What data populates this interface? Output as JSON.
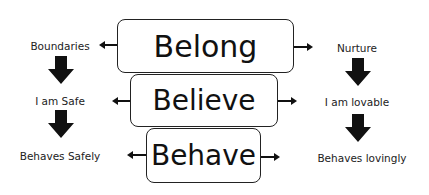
{
  "diagram": {
    "center": [
      {
        "id": "belong",
        "label": "Belong"
      },
      {
        "id": "believe",
        "label": "Believe"
      },
      {
        "id": "behave",
        "label": "Behave"
      }
    ],
    "left_column": [
      {
        "label": "Boundaries"
      },
      {
        "label": "I am Safe"
      },
      {
        "label": "Behaves Safely"
      }
    ],
    "right_column": [
      {
        "label": "Nurture"
      },
      {
        "label": "I am lovable"
      },
      {
        "label": "Behaves lovingly"
      }
    ],
    "colors": {
      "stroke": "#222222",
      "arrow_fill": "#111111",
      "background": "#ffffff"
    }
  }
}
